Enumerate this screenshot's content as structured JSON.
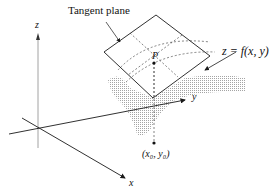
{
  "labels": {
    "tangent_plane": "Tangent plane",
    "surface": "z = f(x, y)",
    "point_P": "P",
    "base_point": "(x₀, y₀)",
    "axis_x": "x",
    "axis_y": "y",
    "axis_z": "z"
  },
  "colors": {
    "line": "#1a1a1a",
    "shade": "#c8c8c8",
    "dashed": "#333333"
  }
}
